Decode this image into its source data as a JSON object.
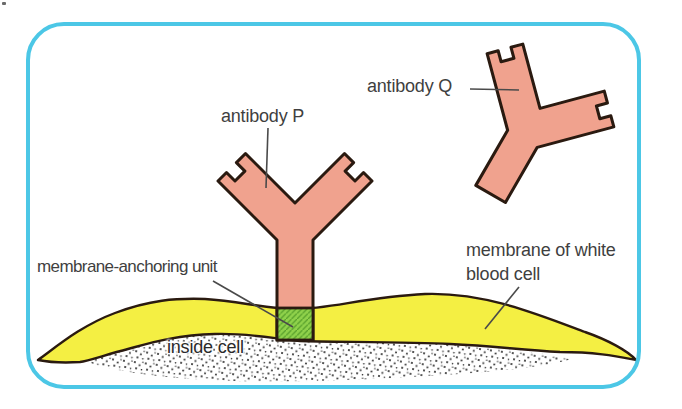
{
  "figure": {
    "labels": {
      "antibody_p": "antibody P",
      "antibody_q": "antibody Q",
      "anchor_unit": "membrane-anchoring unit",
      "membrane_line1": "membrane of white",
      "membrane_line2": "blood cell",
      "inside_cell": "inside cell"
    },
    "colors": {
      "frame": "#4cc7e6",
      "antibody_fill": "#f0a28e",
      "membrane_fill": "#f4ef43",
      "anchor_fill": "#8fd14b",
      "anchor_hatch": "#57a02c",
      "outline": "#2a1a10",
      "leader": "#4a4a4a",
      "label_text": "#3f3f3f",
      "inside_text": "#2a2a2a",
      "dot": "#1c1c1c",
      "background": "#ffffff"
    }
  }
}
